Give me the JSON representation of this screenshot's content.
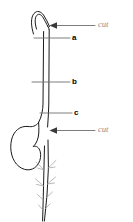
{
  "figure": {
    "background_color": "#ffffff",
    "stroke_color": "#1a1a1a",
    "root_hair_color": "#9a9a9a",
    "leader_line_color": "#6f6f6f",
    "label_letter_color": "#000000",
    "label_cut_color": "#8a8a8a"
  },
  "labels": {
    "cut_top": "cut",
    "cut_bottom": "cut",
    "a": "a",
    "b": "b",
    "c": "c"
  },
  "parts": {
    "plumule_hook": "hooked shoot tip",
    "stem": "stem",
    "cotyledon": "seed / cotyledon",
    "root": "primary root",
    "root_hairs": "lateral root hairs"
  },
  "annotations": [
    {
      "id": "cut-top",
      "text": "cut",
      "type": "arrow",
      "target": "stem below hook",
      "x": 98,
      "y": 22
    },
    {
      "id": "a",
      "text": "a",
      "type": "leader",
      "target": "upper stem",
      "x": 73,
      "y": 38
    },
    {
      "id": "b",
      "text": "b",
      "type": "leader",
      "target": "mid stem",
      "x": 73,
      "y": 82
    },
    {
      "id": "c",
      "text": "c",
      "type": "leader",
      "target": "stem at seed",
      "x": 75,
      "y": 113
    },
    {
      "id": "cut-bottom",
      "text": "cut",
      "type": "arrow",
      "target": "stem below seed",
      "x": 98,
      "y": 127
    }
  ]
}
